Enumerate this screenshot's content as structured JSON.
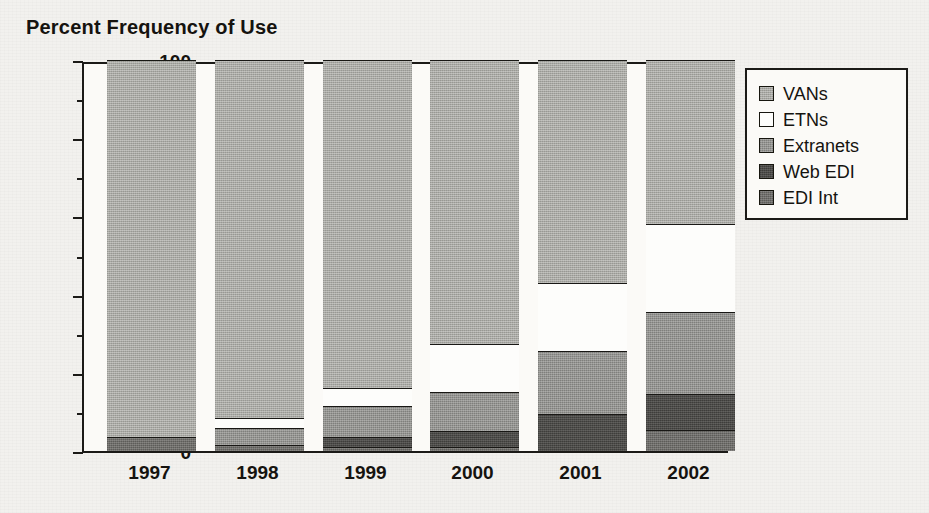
{
  "chart_data": {
    "type": "bar",
    "subtype": "stacked-bar-100",
    "title": "Percent Frequency of Use",
    "xlabel": "",
    "ylabel": "",
    "ylim": [
      0,
      100
    ],
    "grid": false,
    "legend_position": "right",
    "categories": [
      "1997",
      "1998",
      "1999",
      "2000",
      "2001",
      "2002"
    ],
    "ytick_labels": [
      "0",
      "20",
      "40",
      "60",
      "80",
      "100"
    ],
    "ytick_values": [
      0,
      20,
      40,
      60,
      80,
      100
    ],
    "yminor_values": [
      10,
      30,
      50,
      70,
      90
    ],
    "stack_order_bottom_to_top": [
      "EDI Int",
      "Web EDI",
      "Extranets",
      "ETNs",
      "VANs"
    ],
    "series": [
      {
        "name": "VANs",
        "color": "#a9a9a4",
        "values": [
          96.5,
          91.5,
          84.0,
          72.5,
          57.0,
          42.0
        ]
      },
      {
        "name": "ETNs",
        "color": "#fdfdfb",
        "values": [
          0.0,
          2.5,
          4.5,
          12.5,
          17.5,
          22.5
        ]
      },
      {
        "name": "Extranets",
        "color": "#949490",
        "values": [
          0.0,
          4.5,
          8.0,
          10.0,
          16.0,
          21.0
        ]
      },
      {
        "name": "Web EDI",
        "color": "#4c4b48",
        "values": [
          0.0,
          0.0,
          2.5,
          4.0,
          9.5,
          9.0
        ]
      },
      {
        "name": "EDI Int",
        "color": "#6f6e6a",
        "values": [
          3.5,
          1.5,
          1.0,
          1.0,
          0.0,
          5.5
        ]
      }
    ],
    "cumulative_tops": {
      "1997": {
        "EDI Int": 3.5,
        "Web EDI": 3.5,
        "Extranets": 3.5,
        "ETNs": 3.5,
        "VANs": 100
      },
      "1998": {
        "EDI Int": 1.5,
        "Web EDI": 1.5,
        "Extranets": 6.0,
        "ETNs": 8.5,
        "VANs": 100
      },
      "1999": {
        "EDI Int": 1.0,
        "Web EDI": 3.5,
        "Extranets": 11.5,
        "ETNs": 16.0,
        "VANs": 100
      },
      "2000": {
        "EDI Int": 1.0,
        "Web EDI": 5.0,
        "Extranets": 15.0,
        "ETNs": 27.5,
        "VANs": 100
      },
      "2001": {
        "EDI Int": 0.0,
        "Web EDI": 9.5,
        "Extranets": 25.5,
        "ETNs": 43.0,
        "VANs": 100
      },
      "2002": {
        "EDI Int": 5.5,
        "Web EDI": 14.5,
        "Extranets": 35.5,
        "ETNs": 58.0,
        "VANs": 100
      }
    }
  },
  "legend": {
    "items": [
      {
        "label": "VANs",
        "swatch": "legend-swatch-vans"
      },
      {
        "label": "ETNs",
        "swatch": "legend-swatch-etns"
      },
      {
        "label": "Extranets",
        "swatch": "legend-swatch-extranets"
      },
      {
        "label": "Web EDI",
        "swatch": "legend-swatch-web-edi"
      },
      {
        "label": "EDI Int",
        "swatch": "legend-swatch-edi-int"
      }
    ]
  },
  "colors": {
    "axis": "#1b1a17",
    "text": "#15130f",
    "background": "#f2f1ee",
    "plot_background": "#fbfaf7"
  }
}
